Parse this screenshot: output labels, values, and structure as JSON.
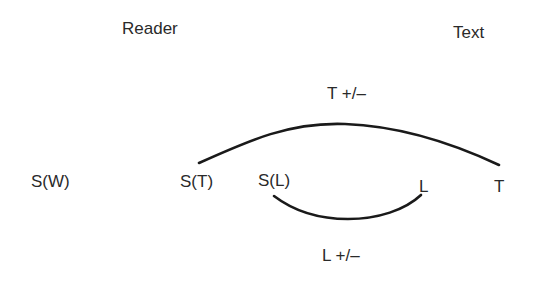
{
  "headers": {
    "reader": "Reader",
    "text": "Text"
  },
  "nodes": {
    "s_w": "S(W)",
    "s_t": "S(T)",
    "s_l": "S(L)",
    "l": "L",
    "t": "T"
  },
  "arcs": {
    "top_label": "T +/–",
    "bottom_label": "L +/–",
    "stroke_color": "#1a1a1a"
  }
}
